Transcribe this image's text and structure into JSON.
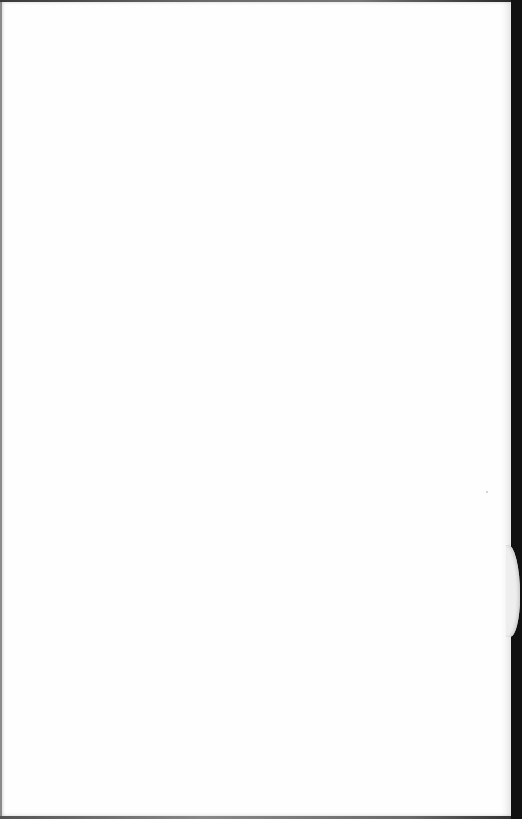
{
  "page": {
    "type": "blank scanned page",
    "text": ""
  },
  "colors": {
    "paper": "#fefefe",
    "scan_background": "#111111",
    "edge_shadow": "#8a8a8a"
  }
}
